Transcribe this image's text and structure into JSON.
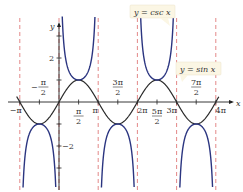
{
  "chart_data": {
    "type": "line",
    "title": "",
    "xlabel": "x",
    "ylabel": "y",
    "series": [
      {
        "name": "y = sin x",
        "function": "sin(x)",
        "color": "#2a2a2a"
      },
      {
        "name": "y = csc x",
        "function": "1/sin(x)",
        "color": "#2b3580"
      }
    ],
    "asymptotes": [
      "-π",
      "0",
      "π",
      "2π",
      "3π",
      "4π"
    ],
    "asymptote_color": "#e07b7b",
    "x_ticks": [
      "-π",
      "-π/2",
      "π/2",
      "π",
      "3π/2",
      "2π",
      "5π/2",
      "3π",
      "7π/2",
      "4π"
    ],
    "y_ticks": [
      "2",
      "-2"
    ],
    "xlim": [
      "-π",
      "4π"
    ],
    "ylim": [
      -4,
      4
    ],
    "annotations": [
      "y = csc x",
      "y = sin x"
    ]
  },
  "labels": {
    "csc": "y = csc x",
    "sin": "y = sin x",
    "x_axis": "x",
    "y_axis": "y",
    "y2": "2",
    "ym2": "−2"
  }
}
